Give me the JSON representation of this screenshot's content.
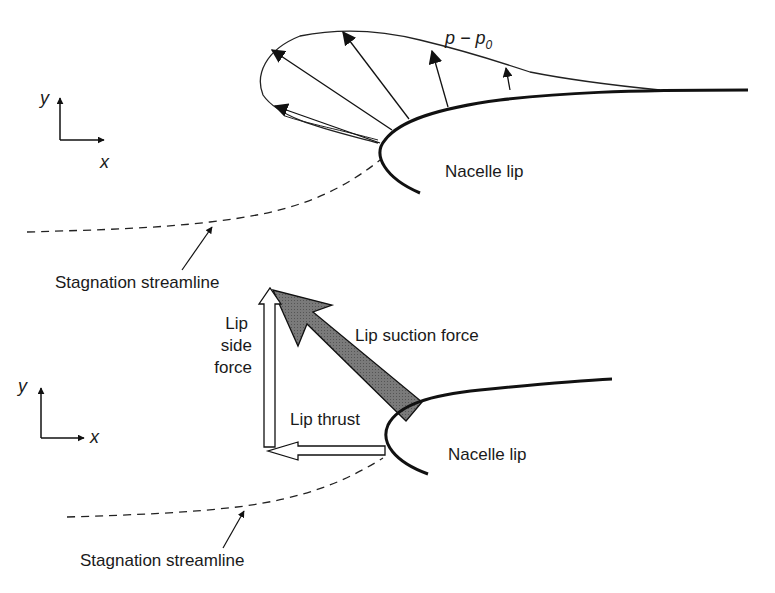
{
  "top_panel": {
    "axes": {
      "y_label": "y",
      "x_label": "x"
    },
    "pressure_label": {
      "main": "p − p",
      "subscript": "0"
    },
    "nacelle_label": "Nacelle lip",
    "streamline_label": "Stagnation streamline"
  },
  "bottom_panel": {
    "axes": {
      "y_label": "y",
      "x_label": "x"
    },
    "suction_force_label": "Lip suction force",
    "side_force_label": [
      "Lip",
      "side",
      "force"
    ],
    "thrust_label": "Lip thrust",
    "nacelle_label": "Nacelle lip",
    "streamline_label": "Stagnation streamline"
  },
  "colors": {
    "line": "#111111",
    "suction_arrow_fill": "#6e6e6e",
    "hollow_arrow_fill": "#ffffff"
  }
}
